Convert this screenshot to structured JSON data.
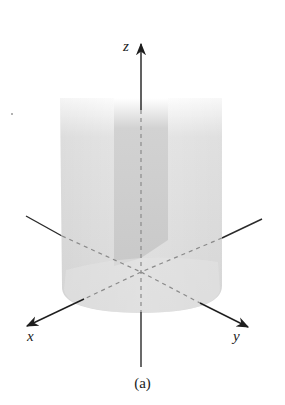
{
  "figure": {
    "type": "3d-solid-diagram",
    "caption": "(a)",
    "axes": {
      "x": {
        "label": "x"
      },
      "y": {
        "label": "y"
      },
      "z": {
        "label": "z"
      }
    },
    "colors": {
      "axis": "#2a2a2a",
      "cylinder_fill": "#d9d9d9",
      "inner_slab_fill": "#c8c8c8",
      "background": "#ffffff"
    }
  }
}
